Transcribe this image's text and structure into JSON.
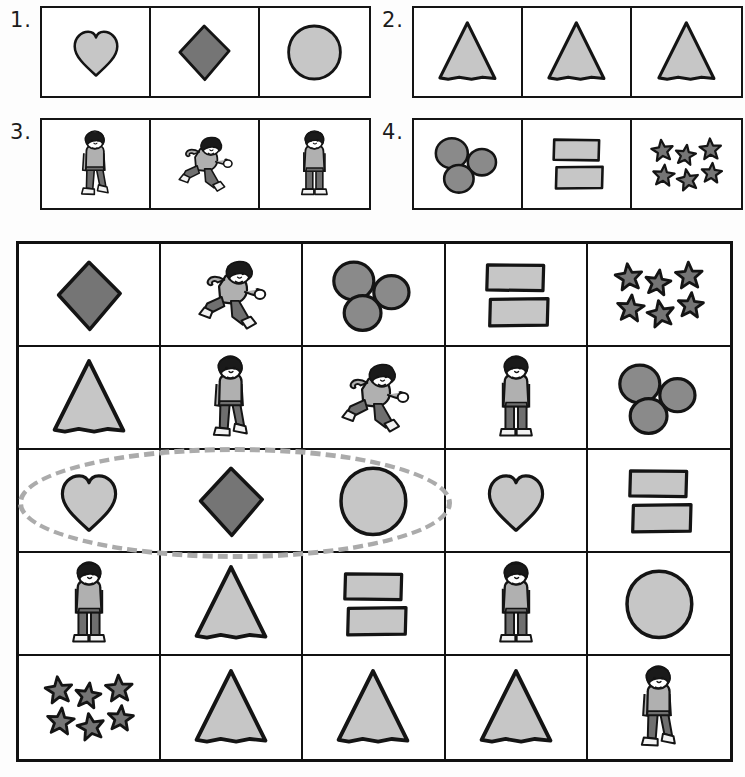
{
  "worksheet": {
    "title": "Shape and figure sorting worksheet",
    "palette": {
      "ink": "#141414",
      "light_gray": "#c6c6c6",
      "mid_gray": "#8a8a8a",
      "dark_gray": "#757575",
      "selection_dash": "#ababab",
      "paper": "#ffffff"
    }
  },
  "exercises": [
    {
      "number": "1.",
      "cells": [
        {
          "icon": "heart-shape",
          "fill": "light",
          "count": 1
        },
        {
          "icon": "diamond-shape",
          "fill": "dark",
          "count": 1
        },
        {
          "icon": "circle-shape",
          "fill": "light",
          "count": 1
        }
      ]
    },
    {
      "number": "2.",
      "cells": [
        {
          "icon": "triangle-shape",
          "fill": "light",
          "count": 1
        },
        {
          "icon": "triangle-shape",
          "fill": "light",
          "count": 1
        },
        {
          "icon": "triangle-shape",
          "fill": "light",
          "count": 1
        }
      ]
    },
    {
      "number": "3.",
      "cells": [
        {
          "icon": "boy-walking-figure",
          "fill": "none",
          "count": 1
        },
        {
          "icon": "boy-running-figure",
          "fill": "none",
          "count": 1
        },
        {
          "icon": "boy-standing-figure",
          "fill": "none",
          "count": 1
        }
      ]
    },
    {
      "number": "4.",
      "cells": [
        {
          "icon": "circle-group",
          "fill": "mid",
          "count": 3
        },
        {
          "icon": "rectangle-group",
          "fill": "light",
          "count": 2
        },
        {
          "icon": "star-group",
          "fill": "dark",
          "count": 6
        }
      ]
    }
  ],
  "grid": {
    "rows": 5,
    "columns": 5,
    "cells": [
      {
        "icon": "diamond-shape",
        "fill": "dark",
        "count": 1
      },
      {
        "icon": "boy-running-figure",
        "fill": "none",
        "count": 1
      },
      {
        "icon": "circle-group",
        "fill": "mid",
        "count": 3
      },
      {
        "icon": "rectangle-group",
        "fill": "light",
        "count": 2
      },
      {
        "icon": "star-group",
        "fill": "dark",
        "count": 6
      },
      {
        "icon": "triangle-shape",
        "fill": "light",
        "count": 1
      },
      {
        "icon": "boy-walking-figure",
        "fill": "none",
        "count": 1
      },
      {
        "icon": "boy-running-figure",
        "fill": "none",
        "count": 1
      },
      {
        "icon": "boy-standing-figure",
        "fill": "none",
        "count": 1
      },
      {
        "icon": "circle-group",
        "fill": "mid",
        "count": 3
      },
      {
        "icon": "heart-shape",
        "fill": "light",
        "count": 1
      },
      {
        "icon": "diamond-shape",
        "fill": "dark",
        "count": 1
      },
      {
        "icon": "circle-shape",
        "fill": "light",
        "count": 1
      },
      {
        "icon": "heart-shape",
        "fill": "light",
        "count": 1
      },
      {
        "icon": "rectangle-group",
        "fill": "light",
        "count": 2
      },
      {
        "icon": "boy-standing-figure",
        "fill": "none",
        "count": 1
      },
      {
        "icon": "triangle-shape",
        "fill": "light",
        "count": 1
      },
      {
        "icon": "rectangle-group",
        "fill": "light",
        "count": 2
      },
      {
        "icon": "boy-standing-figure",
        "fill": "none",
        "count": 1
      },
      {
        "icon": "circle-shape",
        "fill": "light",
        "count": 1
      },
      {
        "icon": "star-group",
        "fill": "dark",
        "count": 6
      },
      {
        "icon": "triangle-shape",
        "fill": "light",
        "count": 1
      },
      {
        "icon": "triangle-shape",
        "fill": "light",
        "count": 1
      },
      {
        "icon": "triangle-shape",
        "fill": "light",
        "count": 1
      },
      {
        "icon": "boy-walking-figure",
        "fill": "none",
        "count": 1
      }
    ]
  },
  "annotation": {
    "type": "dashed-oval",
    "covers_row": 3,
    "covers_columns": [
      1,
      2,
      3
    ],
    "color": "#ababab"
  }
}
